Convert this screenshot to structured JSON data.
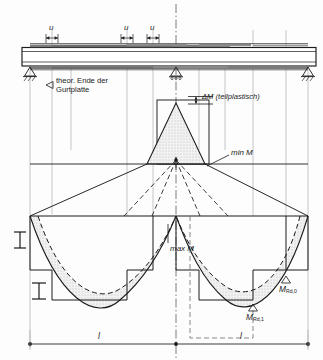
{
  "diagram": {
    "background": "#fdfdfd",
    "ink": "#1b1b1b",
    "fill_stipple": "#e9e9e9",
    "structure": {
      "spans": 2,
      "span_label": "l",
      "supports": [
        {
          "name": "support-left",
          "type": "pinned-hatched",
          "x": 30
        },
        {
          "name": "support-mid",
          "type": "roller-triangle",
          "x": 176
        },
        {
          "name": "support-right",
          "type": "pinned-hatched",
          "x": 308
        }
      ],
      "beam": {
        "top": 47,
        "bottom": 66,
        "left": 22,
        "right": 316
      }
    },
    "dimensions": {
      "u_label": "u",
      "u_marks": [
        {
          "name": "u-mark-1",
          "x": 52
        },
        {
          "name": "u-mark-2",
          "x": 127
        },
        {
          "name": "u-mark-3",
          "x": 153
        }
      ],
      "span_marks": [
        {
          "name": "span-left",
          "label": "l",
          "cx": 100
        },
        {
          "name": "span-right",
          "label": "l",
          "cx": 242
        }
      ]
    },
    "labels": {
      "theor_end": "theor. Ende der\nGurtplatte",
      "theor_end_line1": "theor. Ende der",
      "theor_end_line2": "Gurtplatte",
      "delta_m": "ΔM (teilplastisch)",
      "min_m": "min M",
      "max_m": "max M",
      "m_rd_0_main": "M",
      "m_rd_0_sub": "Rd,0",
      "m_rd_1_main": "M",
      "m_rd_1_sub": "Rd,1"
    },
    "section_symbols": [
      {
        "name": "i-section-upper",
        "x": 22,
        "y": 238
      },
      {
        "name": "i-section-lower",
        "x": 40,
        "y": 288
      }
    ],
    "curves": {
      "min_m_peak": {
        "note": "hogging moment peak over mid support",
        "apex_y": 106
      },
      "max_m_span": {
        "note": "sagging parabolic envelope in each span",
        "baseline_y": 216
      }
    }
  }
}
